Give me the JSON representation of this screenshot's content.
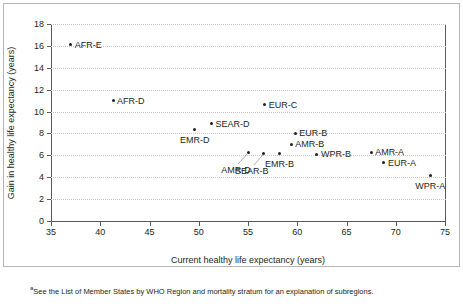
{
  "chart_data": {
    "type": "scatter",
    "title": "",
    "xlabel": "Current healthy life expectancy (years)",
    "ylabel": "Gain in healthy life expectancy (years)",
    "xlim": [
      35,
      75
    ],
    "ylim": [
      0,
      18
    ],
    "xticks": [
      35,
      40,
      45,
      50,
      55,
      60,
      65,
      70,
      75
    ],
    "yticks": [
      0,
      2,
      4,
      6,
      8,
      10,
      12,
      14,
      16,
      18
    ],
    "grid": "horizontal-dotted",
    "legend": "none",
    "marker_color": "#231f20",
    "points": [
      {
        "label": "AFR-E",
        "x": 37.0,
        "y": 16.1,
        "label_pos": "right"
      },
      {
        "label": "AFR-D",
        "x": 41.3,
        "y": 11.0,
        "label_pos": "right"
      },
      {
        "label": "EMR-D",
        "x": 49.6,
        "y": 8.4,
        "label_pos": "below"
      },
      {
        "label": "SEAR-D",
        "x": 51.3,
        "y": 8.9,
        "label_pos": "right"
      },
      {
        "label": "AMR-D",
        "x": 55.0,
        "y": 6.3,
        "label_pos": "leader-left"
      },
      {
        "label": "SEAR-B",
        "x": 56.6,
        "y": 6.2,
        "label_pos": "leader-left"
      },
      {
        "label": "EUR-C",
        "x": 56.7,
        "y": 10.6,
        "label_pos": "right"
      },
      {
        "label": "EMR-B",
        "x": 58.2,
        "y": 6.2,
        "label_pos": "below"
      },
      {
        "label": "AMR-B",
        "x": 59.4,
        "y": 7.0,
        "label_pos": "right"
      },
      {
        "label": "EUR-B",
        "x": 59.8,
        "y": 8.0,
        "label_pos": "right"
      },
      {
        "label": "WPR-B",
        "x": 62.0,
        "y": 6.1,
        "label_pos": "right"
      },
      {
        "label": "AMR-A",
        "x": 67.5,
        "y": 6.3,
        "label_pos": "right"
      },
      {
        "label": "EUR-A",
        "x": 68.8,
        "y": 5.3,
        "label_pos": "right"
      },
      {
        "label": "WPR-A",
        "x": 73.5,
        "y": 4.2,
        "label_pos": "below"
      }
    ]
  },
  "footnote": {
    "marker": "a",
    "text": "See the List of Member States by WHO Region and mortality stratum for an explanation of subregions."
  }
}
